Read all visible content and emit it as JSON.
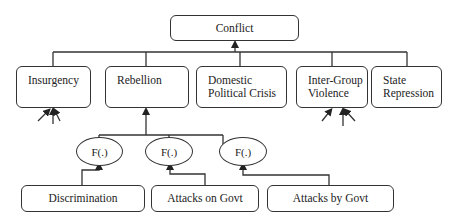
{
  "diagram": {
    "root": {
      "label": "Conflict"
    },
    "outcomes": [
      {
        "id": "insurgency",
        "lines": [
          "Insurgency"
        ]
      },
      {
        "id": "rebellion",
        "lines": [
          "Rebellion"
        ]
      },
      {
        "id": "domestic-political-crisis",
        "lines": [
          "Domestic",
          "Political Crisis"
        ]
      },
      {
        "id": "inter-group-violence",
        "lines": [
          "Inter-Group",
          "Violence"
        ]
      },
      {
        "id": "state-repression",
        "lines": [
          "State",
          "Repression"
        ]
      }
    ],
    "functions": [
      {
        "id": "f1",
        "label": "F(.)"
      },
      {
        "id": "f2",
        "label": "F(.)"
      },
      {
        "id": "f3",
        "label": "F(.)"
      }
    ],
    "inputs": [
      {
        "id": "discrimination",
        "label": "Discrimination"
      },
      {
        "id": "attacks-on-govt",
        "label": "Attacks on Govt"
      },
      {
        "id": "attacks-by-govt",
        "label": "Attacks by Govt"
      }
    ],
    "colors": {
      "stroke": "#333333",
      "background": "#ffffff",
      "text": "#222222"
    }
  }
}
